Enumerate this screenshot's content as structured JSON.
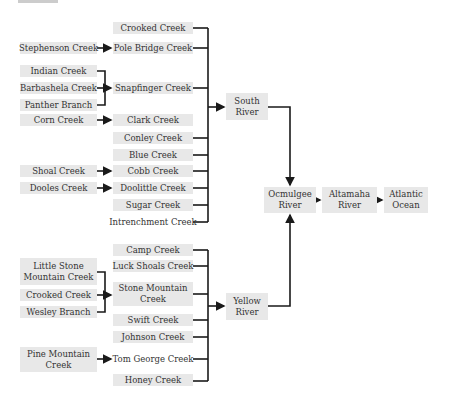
{
  "diagram": {
    "type": "river-tributary-flowchart",
    "left_sources": [
      {
        "id": "stephenson",
        "label": "Stephenson  Creek",
        "flows_to": "pole_bridge"
      },
      {
        "id": "indian",
        "label": "Indian Creek",
        "flows_to": "snapfinger"
      },
      {
        "id": "barbashela",
        "label": "Barbashela Creek",
        "flows_to": "snapfinger"
      },
      {
        "id": "panther",
        "label": "Panther Branch",
        "flows_to": "snapfinger"
      },
      {
        "id": "corn",
        "label": "Corn Creek",
        "flows_to": "clark"
      },
      {
        "id": "shoal",
        "label": "Shoal Creek",
        "flows_to": "cobb"
      },
      {
        "id": "dooles",
        "label": "Dooles Creek",
        "flows_to": "doolittle"
      },
      {
        "id": "little_stone",
        "label": "Little Stone Mountain Creek",
        "flows_to": "stone_mountain"
      },
      {
        "id": "crooked2",
        "label": "Crooked Creek",
        "flows_to": "stone_mountain"
      },
      {
        "id": "wesley",
        "label": "Wesley Branch",
        "flows_to": "stone_mountain"
      },
      {
        "id": "pine_mountain",
        "label": "Pine Mountain Creek",
        "flows_to": "tom_george"
      }
    ],
    "south_tributaries": [
      {
        "id": "crooked1",
        "label": "Crooked Creek"
      },
      {
        "id": "pole_bridge",
        "label": "Pole Bridge Creek"
      },
      {
        "id": "snapfinger",
        "label": "Snapfinger Creek"
      },
      {
        "id": "clark",
        "label": "Clark Creek"
      },
      {
        "id": "conley",
        "label": "Conley Creek"
      },
      {
        "id": "blue",
        "label": "Blue Creek"
      },
      {
        "id": "cobb",
        "label": "Cobb Creek"
      },
      {
        "id": "doolittle",
        "label": "Doolittle Creek"
      },
      {
        "id": "sugar",
        "label": "Sugar Creek"
      },
      {
        "id": "intrenchment",
        "label": "Intrenchment Creek"
      }
    ],
    "yellow_tributaries": [
      {
        "id": "camp",
        "label": "Camp Creek"
      },
      {
        "id": "luck_shoals",
        "label": "Luck Shoals Creek"
      },
      {
        "id": "stone_mountain",
        "label": "Stone Mountain Creek"
      },
      {
        "id": "swift",
        "label": "Swift Creek"
      },
      {
        "id": "johnson",
        "label": "Johnson Creek"
      },
      {
        "id": "tom_george",
        "label": "Tom George Creek"
      },
      {
        "id": "honey",
        "label": "Honey Creek"
      }
    ],
    "rivers": {
      "south": "South River",
      "yellow": "Yellow River",
      "ocmulgee": "Ocmulgee River",
      "altamaha": "Altamaha River",
      "atlantic": "Atlantic Ocean"
    },
    "colors": {
      "box_fill": "#e8e8e8",
      "line": "#1a1a1a",
      "text": "#333333"
    }
  }
}
